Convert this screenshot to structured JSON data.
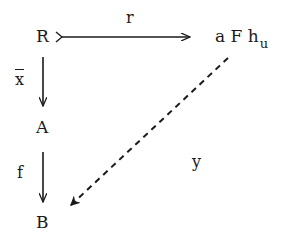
{
  "diagram": {
    "type": "commutative-diagram",
    "nodes": {
      "R": "R",
      "A": "A",
      "B": "B",
      "target_main": "a F h",
      "target_sub": "u"
    },
    "arrows": [
      {
        "from": "R",
        "to": "a F h_u",
        "label": "r",
        "style": "solid",
        "tail": "mono"
      },
      {
        "from": "R",
        "to": "A",
        "label": "x",
        "label_decoration": "overline",
        "style": "solid"
      },
      {
        "from": "A",
        "to": "B",
        "label": "f",
        "style": "solid"
      },
      {
        "from": "a F h_u",
        "to": "B",
        "label": "y",
        "style": "dashed"
      }
    ],
    "labels": {
      "r": "r",
      "xbar": "x",
      "f": "f",
      "y": "y"
    },
    "colors": {
      "ink": "#1a1a1a",
      "background": "#ffffff"
    }
  }
}
